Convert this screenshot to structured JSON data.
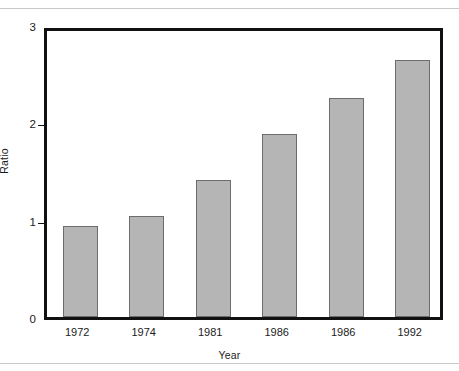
{
  "chart_data": {
    "type": "bar",
    "title": "",
    "xlabel": "Year",
    "ylabel": "Ratio",
    "categories": [
      "1972",
      "1974",
      "1981",
      "1986",
      "1986",
      "1992"
    ],
    "values": [
      0.94,
      1.04,
      1.41,
      1.88,
      2.25,
      2.64
    ],
    "series": [
      {
        "name": "Ratio",
        "values": [
          0.94,
          1.04,
          1.41,
          1.88,
          2.25,
          2.64
        ]
      }
    ],
    "ylim": [
      0,
      3
    ],
    "yticks": [
      0,
      1,
      2,
      3
    ],
    "ytick_labels": [
      "0",
      "1",
      "2",
      "3"
    ],
    "grid": false,
    "legend": false,
    "bar_color": "#b5b5b5",
    "bar_edge_color": "#6d6d6d",
    "frame_color": "#111111",
    "background": "#ffffff"
  }
}
